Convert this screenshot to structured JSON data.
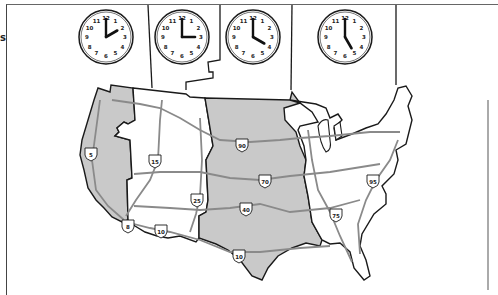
{
  "edge_label": "s",
  "colors": {
    "shaded_zone": "#c9c9c9",
    "unshaded_zone": "#ffffff",
    "border": "#1a1a1a",
    "highway": "#8a8a8a"
  },
  "clocks": [
    {
      "zone": "Pacific",
      "time": "2:00",
      "hour": 2,
      "cx": 106,
      "cy": 37
    },
    {
      "zone": "Mountain",
      "time": "3:00",
      "hour": 3,
      "cx": 182,
      "cy": 37
    },
    {
      "zone": "Central",
      "time": "4:00",
      "hour": 4,
      "cx": 253,
      "cy": 37
    },
    {
      "zone": "Eastern",
      "time": "5:00",
      "hour": 5,
      "cx": 345,
      "cy": 37
    }
  ],
  "clock_numbers": [
    "12",
    "1",
    "2",
    "3",
    "4",
    "5",
    "6",
    "7",
    "8",
    "9",
    "10",
    "11"
  ],
  "zones": [
    {
      "name": "Pacific",
      "shaded": true
    },
    {
      "name": "Mountain",
      "shaded": false
    },
    {
      "name": "Central",
      "shaded": true
    },
    {
      "name": "Eastern",
      "shaded": false
    }
  ],
  "interstates": [
    {
      "label": "5",
      "x": 91,
      "y": 153
    },
    {
      "label": "15",
      "x": 155,
      "y": 160
    },
    {
      "label": "90",
      "x": 242,
      "y": 144
    },
    {
      "label": "70",
      "x": 265,
      "y": 180
    },
    {
      "label": "25",
      "x": 197,
      "y": 199
    },
    {
      "label": "40",
      "x": 246,
      "y": 208
    },
    {
      "label": "8",
      "x": 128,
      "y": 225
    },
    {
      "label": "10",
      "x": 161,
      "y": 230
    },
    {
      "label": "10",
      "x": 239,
      "y": 255
    },
    {
      "label": "75",
      "x": 336,
      "y": 214
    },
    {
      "label": "95",
      "x": 373,
      "y": 180
    }
  ]
}
